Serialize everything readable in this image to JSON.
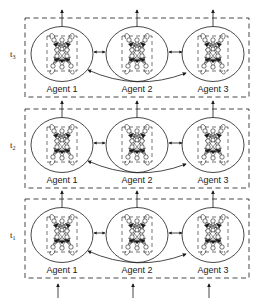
{
  "diagram": {
    "type": "multi-agent recurrent neural network unrolled in time",
    "colors": {
      "stroke": "#1a1a1a",
      "background": "#ffffff"
    },
    "time_steps": [
      {
        "label": "t",
        "sub": "3",
        "agents": [
          "Agent 1",
          "Agent 2",
          "Agent 3"
        ]
      },
      {
        "label": "t",
        "sub": "2",
        "agents": [
          "Agent 1",
          "Agent 2",
          "Agent 3"
        ]
      },
      {
        "label": "t",
        "sub": "1",
        "agents": [
          "Agent 1",
          "Agent 2",
          "Agent 3"
        ]
      }
    ],
    "connections": {
      "neighbor": "bidirectional arrows Agent 1 <-> Agent 2 <-> Agent 3",
      "long_range": "curved bidirectional arrow Agent 1 <-> Agent 3",
      "temporal": "upward arrows from each agent to the same agent at next time step",
      "inputs": "upward input arrows into each agent at t1",
      "outputs": "upward output arrows from each agent at t3"
    }
  }
}
